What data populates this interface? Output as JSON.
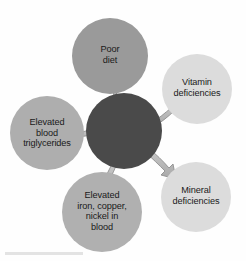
{
  "diagram": {
    "type": "radial-hub-and-spoke",
    "background_color": "#fefefe",
    "hub": {
      "name": "central-hub",
      "label": "",
      "color": "#4a4a4a",
      "cx": 124,
      "cy": 131,
      "r": 38
    },
    "arrow_color": "#b4b4b4",
    "arrow_outline_color": "#8c8c8c",
    "nodes": [
      {
        "id": "poor-diet",
        "label": "Poor\ndiet",
        "color": "#9a9a9a",
        "cx": 110,
        "cy": 56,
        "r": 38,
        "direction": "up",
        "arrow_points_outward": true
      },
      {
        "id": "vitamin-deficiencies",
        "label": "Vitamin\ndeficiencies",
        "color": "#dcdcdc",
        "cx": 197,
        "cy": 89,
        "r": 35,
        "direction": "up-right",
        "arrow_points_outward": true
      },
      {
        "id": "mineral-deficiencies",
        "label": "Mineral\ndeficiencies",
        "color": "#dcdcdc",
        "cx": 196,
        "cy": 197,
        "r": 35,
        "direction": "down-right",
        "arrow_points_outward": true
      },
      {
        "id": "elevated-iron-copper-nickel",
        "label": "Elevated\niron, copper,\nnickel in\nblood",
        "color": "#b0b0b0",
        "cx": 102,
        "cy": 212,
        "r": 40,
        "direction": "down-left",
        "arrow_points_outward": true
      },
      {
        "id": "elevated-blood-triglycerides",
        "label": "Elevated\nblood\ntriglycerides",
        "color": "#aeaeae",
        "cx": 47,
        "cy": 133,
        "r": 37,
        "direction": "left",
        "arrow_points_outward": true
      }
    ]
  }
}
